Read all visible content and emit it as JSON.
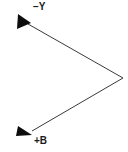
{
  "diagram": {
    "background_color": "#ffffff",
    "line_color": "#3a3a3a",
    "arrowhead_color": "#0d0d0d",
    "text_color": "#1a1a1a",
    "width": 128,
    "height": 152,
    "vertex": {
      "x": 123,
      "y": 78
    },
    "rays": [
      {
        "id": "ray-minus-y",
        "label": "−Y",
        "direction": "up-left",
        "start": {
          "x": 123,
          "y": 78
        },
        "end": {
          "x": 24,
          "y": 22
        },
        "arrow_tip": {
          "x": 18,
          "y": 19
        },
        "label_position": {
          "x": 33,
          "y": 2
        }
      },
      {
        "id": "ray-plus-b",
        "label": "+B",
        "direction": "down-left",
        "start": {
          "x": 123,
          "y": 78
        },
        "end": {
          "x": 28,
          "y": 133
        },
        "arrow_tip": {
          "x": 17,
          "y": 128
        },
        "label_position": {
          "x": 34,
          "y": 136
        }
      }
    ],
    "labels": {
      "top": "−Y",
      "bottom": "+B"
    }
  }
}
